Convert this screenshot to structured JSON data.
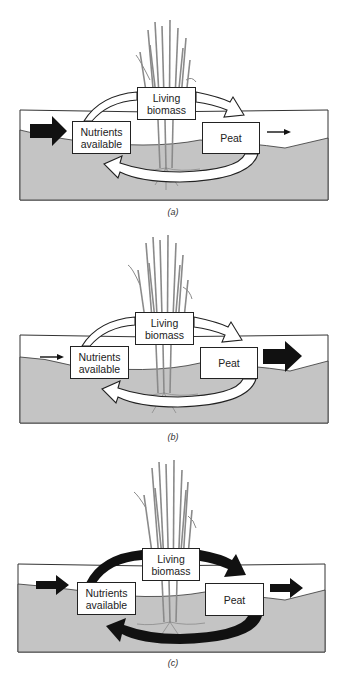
{
  "figure": {
    "colors": {
      "soil": "#c4c4c4",
      "water": "#ffffff",
      "outline": "#222222",
      "grass": "#8a8a8a",
      "arrow_dark": "#111111",
      "arrow_light": "#ffffff"
    },
    "panels": [
      {
        "label": "(a)",
        "boxes": {
          "nutrients": "Nutrients available",
          "nutrients_l1": "Nutrients",
          "nutrients_l2": "available",
          "living_l1": "Living",
          "living_l2": "biomass",
          "peat": "Peat"
        },
        "inflow": "large",
        "outflow": "small",
        "cycle": "open-white"
      },
      {
        "label": "(b)",
        "boxes": {
          "nutrients_l1": "Nutrients",
          "nutrients_l2": "available",
          "living_l1": "Living",
          "living_l2": "biomass",
          "peat": "Peat"
        },
        "inflow": "small",
        "outflow": "large",
        "cycle": "open-white"
      },
      {
        "label": "(c)",
        "boxes": {
          "nutrients_l1": "Nutrients",
          "nutrients_l2": "available",
          "living_l1": "Living",
          "living_l2": "biomass",
          "peat": "Peat"
        },
        "inflow": "medium",
        "outflow": "medium",
        "cycle": "solid-black"
      }
    ]
  }
}
